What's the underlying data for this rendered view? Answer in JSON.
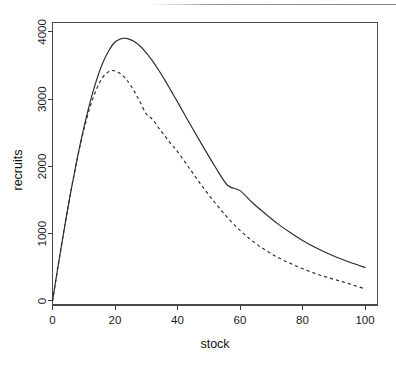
{
  "figure": {
    "background_color": "#ffffff",
    "line_color": "#2b2b2b",
    "axis_color": "#3a3a3a"
  },
  "chart_data": {
    "type": "line",
    "title": "",
    "subtitle": "",
    "xlabel": "stock",
    "ylabel": "recruits",
    "xlim": [
      0,
      104
    ],
    "ylim": [
      -60,
      4140
    ],
    "xticks": [
      0,
      20,
      40,
      60,
      80,
      100
    ],
    "xticklabels": [
      "0",
      "20",
      "40",
      "60",
      "80",
      "100"
    ],
    "yticks": [
      0,
      1000,
      2000,
      3000,
      4000
    ],
    "yticklabels": [
      "0",
      "1000",
      "2000",
      "3000",
      "4000"
    ],
    "grid": false,
    "legend": "none",
    "frame": "box",
    "annotations": [],
    "series": [
      {
        "name": "solid-curve",
        "style": "solid",
        "x": [
          0,
          2,
          4,
          6,
          8,
          10,
          12,
          14,
          16,
          18,
          20,
          22,
          23,
          24,
          26,
          28,
          30,
          32,
          34,
          36,
          38,
          40,
          44,
          48,
          52,
          56,
          60,
          64,
          68,
          72,
          76,
          80,
          84,
          88,
          92,
          96,
          100
        ],
        "y": [
          0,
          580,
          1140,
          1660,
          2140,
          2570,
          2950,
          3270,
          3530,
          3720,
          3850,
          3900,
          3905,
          3900,
          3860,
          3790,
          3690,
          3570,
          3430,
          3280,
          3120,
          2960,
          2630,
          2310,
          2000,
          1720,
          1640,
          1460,
          1300,
          1150,
          1020,
          900,
          800,
          710,
          630,
          560,
          500
        ]
      },
      {
        "name": "dashed-curve",
        "style": "dashed",
        "x": [
          0,
          2,
          4,
          6,
          8,
          10,
          12,
          14,
          16,
          18,
          19,
          20,
          22,
          24,
          26,
          28,
          30,
          32,
          34,
          36,
          38,
          40,
          44,
          48,
          52,
          56,
          60,
          64,
          68,
          72,
          76,
          80,
          84,
          88,
          92,
          96,
          100
        ],
        "y": [
          0,
          580,
          1140,
          1660,
          2130,
          2540,
          2880,
          3140,
          3320,
          3410,
          3425,
          3420,
          3370,
          3270,
          3130,
          2960,
          2780,
          2700,
          2570,
          2450,
          2330,
          2220,
          1960,
          1700,
          1460,
          1240,
          1050,
          890,
          760,
          650,
          560,
          480,
          410,
          350,
          295,
          240,
          180
        ]
      }
    ]
  }
}
